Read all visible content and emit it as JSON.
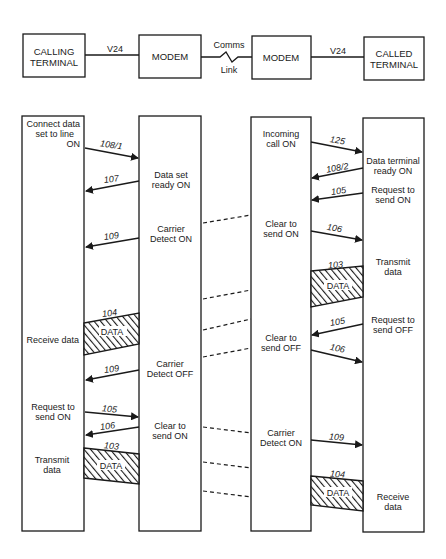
{
  "top_diagram": {
    "calling_terminal": [
      "CALLING",
      "TERMINAL"
    ],
    "modem_left": "MODEM",
    "modem_right": "MODEM",
    "called_terminal": [
      "CALLED",
      "TERMINAL"
    ],
    "link_left": "V24",
    "link_right": "V24",
    "comms_link": [
      "Comms",
      "Link"
    ]
  },
  "calling_terminal_notes": {
    "connect": [
      "Connect data",
      "set to line",
      "ON"
    ],
    "receive": "Receive data",
    "rts_on": [
      "Request to",
      "send ON"
    ],
    "transmit": [
      "Transmit",
      "data"
    ]
  },
  "modem_left_notes": {
    "dsr_on": [
      "Data set",
      "ready ON"
    ],
    "cd_on": [
      "Carrier",
      "Detect ON"
    ],
    "cd_off": [
      "Carrier",
      "Detect OFF"
    ],
    "cts_on": [
      "Clear to",
      "send ON"
    ]
  },
  "modem_right_notes": {
    "incoming": [
      "Incoming",
      "call ON"
    ],
    "cts_on": [
      "Clear to",
      "send ON"
    ],
    "cts_off": [
      "Clear to",
      "send OFF"
    ],
    "cd_on": [
      "Carrier",
      "Detect ON"
    ]
  },
  "called_terminal_notes": {
    "dtr_on": [
      "Data terminal",
      "ready ON"
    ],
    "rts_on": [
      "Request to",
      "send ON"
    ],
    "transmit": [
      "Transmit",
      "data"
    ],
    "rts_off": [
      "Request to",
      "send OFF"
    ],
    "receive": [
      "Receive",
      "data"
    ]
  },
  "signals": {
    "s108_1": "108/1",
    "s107": "107",
    "s109a": "109",
    "s104a": "104",
    "s109b": "109",
    "s105a": "105",
    "s106a": "106",
    "s103a": "103",
    "s125": "125",
    "s108_2": "108/2",
    "s105b": "105",
    "s106b": "106",
    "s103b": "103",
    "s105c": "105",
    "s106c": "106",
    "s109c": "109",
    "s104b": "104"
  },
  "data_label": "DATA"
}
